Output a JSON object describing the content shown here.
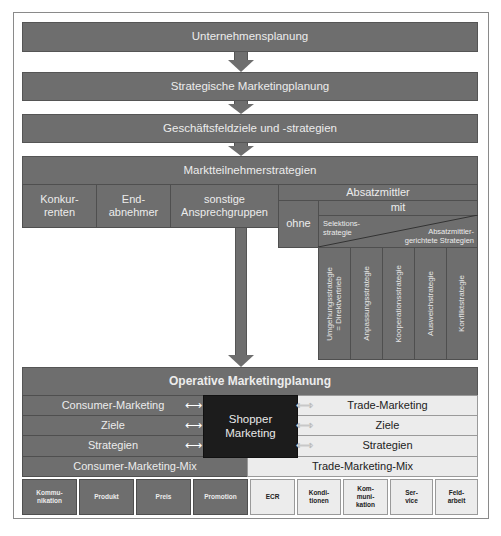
{
  "levels": {
    "unternehmensplanung": "Unternehmensplanung",
    "strategische": "Strategische Marketingplanung",
    "geschaeftsfeld": "Geschäftsfeldziele und -strategien",
    "marktteilnehmer": "Marktteilnehmerstrategien"
  },
  "marktteilnehmer": {
    "konkurrenten": "Konkur-\nrenten",
    "endabnehmer": "End-\nabnehmer",
    "sonstige": "sonstige\nAnsprechgruppen",
    "absatzmittler": "Absatzmittler",
    "ohne": "ohne",
    "mit": "mit",
    "selektion": "Selektions-\nstrategie",
    "absatzmittlergerichtete": "Absatzmittler-\ngerichtete  Strategien",
    "strategies": [
      "Umgehungsstrategie\n= Direktvertrieb",
      "Anpassungsstrategie",
      "Kooperationsstrategie",
      "Ausweichstrategie",
      "Konfliktstrategie"
    ]
  },
  "operative": {
    "title": "Operative Marketingplanung",
    "consumer": [
      "Consumer-Marketing",
      "Ziele",
      "Strategien"
    ],
    "trade": [
      "Trade-Marketing",
      "Ziele",
      "Strategien"
    ],
    "shopper": "Shopper\nMarketing",
    "consumer_mix": "Consumer-Marketing-Mix",
    "trade_mix": "Trade-Marketing-Mix",
    "consumer_mix_items": [
      "Kommu-\nnikation",
      "Produkt",
      "Preis",
      "Promotion"
    ],
    "trade_mix_items": [
      "ECR",
      "Kondi-\ntionen",
      "Kom-\nmuni-\nkation",
      "Ser-\nvice",
      "Feld-\narbeit"
    ]
  },
  "colors": {
    "dark_gray": "#6e6e6e",
    "light_gray": "#ececec",
    "shopper_black": "#1c1c1c"
  }
}
